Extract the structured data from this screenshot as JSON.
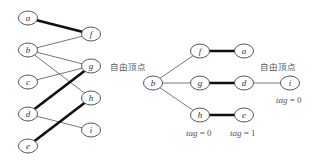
{
  "left_graph": {
    "nodes": [
      {
        "id": "a",
        "label": "a",
        "x": 28,
        "y": 18
      },
      {
        "id": "b",
        "label": "b",
        "x": 28,
        "y": 50
      },
      {
        "id": "c",
        "label": "c",
        "x": 28,
        "y": 82
      },
      {
        "id": "d",
        "label": "d",
        "x": 28,
        "y": 114
      },
      {
        "id": "e",
        "label": "e",
        "x": 28,
        "y": 146
      },
      {
        "id": "f",
        "label": "f",
        "x": 91,
        "y": 34
      },
      {
        "id": "g",
        "label": "g",
        "x": 91,
        "y": 66
      },
      {
        "id": "h",
        "label": "h",
        "x": 91,
        "y": 98
      },
      {
        "id": "i",
        "label": "i",
        "x": 91,
        "y": 130
      }
    ],
    "edges": [
      {
        "from": "a",
        "to": "f",
        "matched": true
      },
      {
        "from": "b",
        "to": "f",
        "matched": false
      },
      {
        "from": "b",
        "to": "g",
        "matched": false
      },
      {
        "from": "b",
        "to": "h",
        "matched": false
      },
      {
        "from": "c",
        "to": "g",
        "matched": false
      },
      {
        "from": "d",
        "to": "g",
        "matched": true
      },
      {
        "from": "d",
        "to": "i",
        "matched": false
      },
      {
        "from": "e",
        "to": "h",
        "matched": true
      }
    ]
  },
  "right_tree": {
    "nodes": [
      {
        "id": "b",
        "label": "b",
        "x": 153,
        "y": 83
      },
      {
        "id": "f",
        "label": "f",
        "x": 200,
        "y": 51
      },
      {
        "id": "g",
        "label": "g",
        "x": 200,
        "y": 83
      },
      {
        "id": "h",
        "label": "h",
        "x": 200,
        "y": 115
      },
      {
        "id": "a",
        "label": "a",
        "x": 244,
        "y": 51
      },
      {
        "id": "d",
        "label": "d",
        "x": 244,
        "y": 83
      },
      {
        "id": "e",
        "label": "e",
        "x": 244,
        "y": 115
      },
      {
        "id": "i",
        "label": "i",
        "x": 290,
        "y": 83
      }
    ],
    "edges": [
      {
        "from": "b",
        "to": "f",
        "matched": false
      },
      {
        "from": "b",
        "to": "g",
        "matched": false
      },
      {
        "from": "b",
        "to": "h",
        "matched": false
      },
      {
        "from": "f",
        "to": "a",
        "matched": true
      },
      {
        "from": "g",
        "to": "d",
        "matched": true
      },
      {
        "from": "h",
        "to": "e",
        "matched": true
      },
      {
        "from": "d",
        "to": "i",
        "matched": false
      }
    ],
    "labels": {
      "free_vertex_b": "自由顶点",
      "free_vertex_i": "自由顶点",
      "tag_h": {
        "name": "tag",
        "value": " = 0"
      },
      "tag_e": {
        "name": "tag",
        "value": " = 1"
      },
      "tag_i": {
        "name": "tag",
        "value": " = 0"
      }
    }
  },
  "colors": {
    "thin_edge": "#555555",
    "thick_edge": "#111111",
    "node_stroke": "#444444",
    "text": "#555555"
  }
}
